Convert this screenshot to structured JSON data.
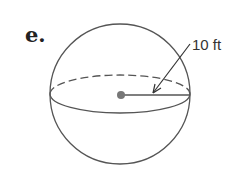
{
  "problem": {
    "label": "e."
  },
  "figure": {
    "shape": "sphere",
    "radius_label": "10 ft",
    "colors": {
      "stroke": "#555555",
      "dot": "#777777"
    }
  }
}
